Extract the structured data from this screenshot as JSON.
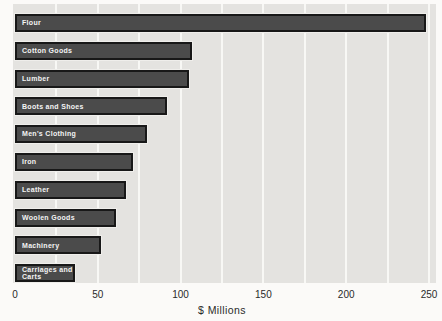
{
  "chart_data": {
    "type": "bar",
    "orientation": "horizontal",
    "title": "",
    "categories": [
      "Flour",
      "Cotton Goods",
      "Lumber",
      "Boots and Shoes",
      "Men's Clothing",
      "Iron",
      "Leather",
      "Woolen Goods",
      "Machinery",
      "Carriages and Carts"
    ],
    "values": [
      248,
      107,
      105,
      92,
      80,
      71,
      67,
      61,
      52,
      36
    ],
    "xlabel": "$ Millions",
    "x_ticks": [
      0,
      50,
      100,
      150,
      200,
      250
    ],
    "xlim": [
      0,
      250
    ],
    "grid": "vertical gridlines every 25 units",
    "legend": "none",
    "bar_labels_inside": true
  },
  "colors": {
    "page_bg": "#fbfaf8",
    "plot_bg": "#e4e3e0",
    "gridline": "#f8f8f5",
    "bar_fill": "#4b4b4b",
    "bar_border": "#181818",
    "bar_halo": "#efeeeb",
    "bar_label_text": "#f4f4f4",
    "axis_text": "#2a2a2a"
  }
}
